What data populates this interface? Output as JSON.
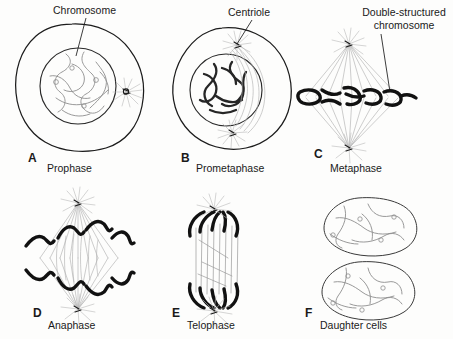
{
  "figure": {
    "title_implicit": "Stages of mitosis",
    "background_color": "#fdfdfc",
    "ink_color": "#1a1a1a",
    "chromatin_color": "#8d8d8d",
    "spindle_color": "#b2b2b2"
  },
  "callouts": {
    "chromosome": "Chromosome",
    "centriole": "Centriole",
    "double_structured_line1": "Double-structured",
    "double_structured_line2": "chromosome"
  },
  "panels": [
    {
      "letter": "A",
      "name": "Prophase"
    },
    {
      "letter": "B",
      "name": "Prometaphase"
    },
    {
      "letter": "C",
      "name": "Metaphase"
    },
    {
      "letter": "D",
      "name": "Anaphase"
    },
    {
      "letter": "E",
      "name": "Telophase"
    },
    {
      "letter": "F",
      "name": "Daughter cells"
    }
  ]
}
